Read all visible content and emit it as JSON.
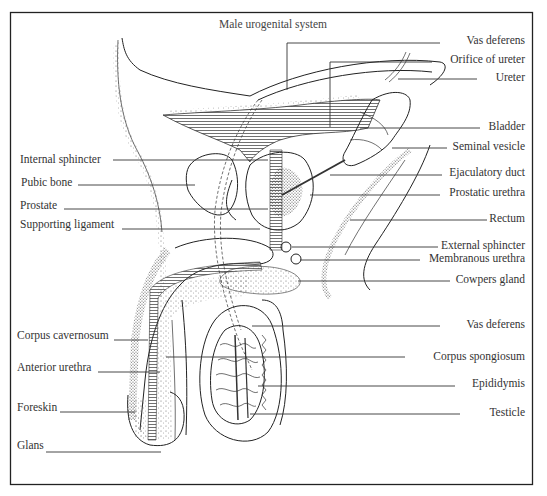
{
  "title": "Male urogenital system",
  "colors": {
    "line": "#333333",
    "frame": "#222222",
    "background": "#ffffff",
    "stipple": "#555555"
  },
  "labels_left": [
    {
      "id": "internal-sphincter",
      "text": "Internal sphincter",
      "x": 20,
      "y": 163,
      "line": [
        113,
        160,
        268,
        160
      ]
    },
    {
      "id": "pubic-bone",
      "text": "Pubic bone",
      "x": 21,
      "y": 186,
      "line": [
        78,
        185,
        195,
        185
      ]
    },
    {
      "id": "prostate",
      "text": "Prostate",
      "x": 20,
      "y": 209,
      "line": [
        64,
        209,
        268,
        209
      ]
    },
    {
      "id": "supporting-ligament",
      "text": "Supporting ligament",
      "x": 20,
      "y": 228,
      "line": [
        122,
        229,
        260,
        229
      ]
    },
    {
      "id": "corpus-cavernosum",
      "text": "Corpus cavernosum",
      "x": 17,
      "y": 339,
      "line": [
        114,
        340,
        148,
        340
      ]
    },
    {
      "id": "anterior-urethra",
      "text": "Anterior urethra",
      "x": 17,
      "y": 371,
      "line": [
        98,
        372,
        160,
        372
      ]
    },
    {
      "id": "foreskin",
      "text": "Foreskin",
      "x": 17,
      "y": 411,
      "line": [
        60,
        412,
        135,
        412
      ]
    },
    {
      "id": "glans",
      "text": "Glans",
      "x": 17,
      "y": 449,
      "line": [
        46,
        452,
        161,
        452
      ]
    }
  ],
  "labels_right": [
    {
      "id": "vas-deferens-top",
      "text": "Vas deferens",
      "x": 525,
      "y": 44,
      "line": [
        287,
        43,
        440,
        43
      ],
      "drop": [
        287,
        43,
        287,
        90
      ]
    },
    {
      "id": "orifice-of-ureter",
      "text": "Orifice of ureter",
      "x": 525,
      "y": 63,
      "line": [
        330,
        62,
        432,
        62
      ],
      "drop": [
        330,
        62,
        330,
        127
      ]
    },
    {
      "id": "ureter",
      "text": "Ureter",
      "x": 525,
      "y": 81,
      "line": [
        398,
        79,
        477,
        79
      ]
    },
    {
      "id": "bladder",
      "text": "Bladder",
      "x": 525,
      "y": 130,
      "line": [
        360,
        128,
        480,
        128
      ]
    },
    {
      "id": "seminal-vesicle",
      "text": "Seminal vesicle",
      "x": 525,
      "y": 150,
      "line": [
        392,
        148,
        447,
        148
      ]
    },
    {
      "id": "ejaculatory-duct",
      "text": "Ejaculatory duct",
      "x": 525,
      "y": 176,
      "line": [
        330,
        175,
        442,
        175
      ]
    },
    {
      "id": "prostatic-urethra",
      "text": "Prostatic urethra",
      "x": 525,
      "y": 196,
      "line": [
        310,
        195,
        440,
        195
      ]
    },
    {
      "id": "rectum",
      "text": "Rectum",
      "x": 525,
      "y": 222,
      "line": [
        350,
        220,
        487,
        220
      ]
    },
    {
      "id": "external-sphincter",
      "text": "External sphincter",
      "x": 525,
      "y": 249,
      "line": [
        292,
        247,
        438,
        247
      ]
    },
    {
      "id": "membranous-urethra",
      "text": "Membranous urethra",
      "x": 525,
      "y": 262,
      "line": [
        300,
        260,
        420,
        260
      ]
    },
    {
      "id": "cowpers-gland",
      "text": "Cowpers gland",
      "x": 525,
      "y": 283,
      "line": [
        298,
        281,
        450,
        281
      ]
    },
    {
      "id": "vas-deferens-bottom",
      "text": "Vas deferens",
      "x": 525,
      "y": 328,
      "line": [
        252,
        326,
        440,
        326
      ]
    },
    {
      "id": "corpus-spongiosum",
      "text": "Corpus spongiosum",
      "x": 525,
      "y": 360,
      "line": [
        166,
        357,
        405,
        357
      ]
    },
    {
      "id": "epididymis",
      "text": "Epididymis",
      "x": 525,
      "y": 387,
      "line": [
        258,
        386,
        455,
        386
      ]
    },
    {
      "id": "testicle",
      "text": "Testicle",
      "x": 525,
      "y": 416,
      "line": [
        250,
        414,
        460,
        414
      ]
    }
  ]
}
